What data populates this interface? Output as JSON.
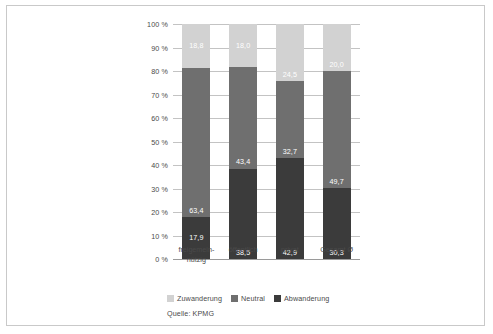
{
  "figure": {
    "source_note": "Quelle: KPMG"
  },
  "chart_data": {
    "type": "bar",
    "subtype": "stacked-column-100pct",
    "title": "",
    "subtitle": "",
    "xlabel": "",
    "ylabel": "",
    "ylim": [
      0,
      100
    ],
    "yticks": [
      0,
      10,
      20,
      30,
      40,
      50,
      60,
      70,
      80,
      90,
      100
    ],
    "ytick_labels": [
      "0 %",
      "10 %",
      "20 %",
      "30 %",
      "40 %",
      "50 %",
      "60 %",
      "70 %",
      "80 %",
      "90 %",
      "100 %"
    ],
    "grid": true,
    "legend_position": "bottom-left",
    "categories": [
      "freigemein-\nnützig",
      "öffentlich",
      "privat",
      "Gesamt Ø"
    ],
    "category_labels": [
      {
        "line1": "freigemein-",
        "line2": "nützig"
      },
      {
        "line1": "öffentlich",
        "line2": ""
      },
      {
        "line1": "privat",
        "line2": ""
      },
      {
        "line1": "Gesamt Ø",
        "line2": ""
      }
    ],
    "series": [
      {
        "name": "Abwanderung",
        "color": "#3b3b3b",
        "values": [
          17.9,
          38.5,
          42.9,
          30.3
        ],
        "value_labels": [
          "17,9",
          "38,5",
          "42,9",
          "30,3"
        ]
      },
      {
        "name": "Neutral",
        "color": "#6f6f6f",
        "values": [
          63.4,
          43.4,
          32.7,
          49.7
        ],
        "value_labels": [
          "63,4",
          "43,4",
          "32,7",
          "49,7"
        ]
      },
      {
        "name": "Zuwanderung",
        "color": "#d2d2d2",
        "values": [
          18.8,
          18.0,
          24.5,
          20.0
        ],
        "value_labels": [
          "18,8",
          "18,0",
          "24,5",
          "20,0"
        ]
      }
    ],
    "legend": [
      {
        "label": "Zuwanderung",
        "color": "#d2d2d2"
      },
      {
        "label": "Neutral",
        "color": "#6f6f6f"
      },
      {
        "label": "Abwanderung",
        "color": "#3b3b3b"
      }
    ]
  }
}
